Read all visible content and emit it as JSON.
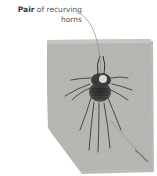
{
  "annotation": {
    "bold_word": "Pair",
    "text_line1_rest": " of recurving",
    "text_line2": "horns"
  },
  "illustration": {
    "subject": "fossil-trilobite-on-rock-slab",
    "slab_color": "#b8b8b4",
    "leader_color": "#8a8a8a"
  }
}
